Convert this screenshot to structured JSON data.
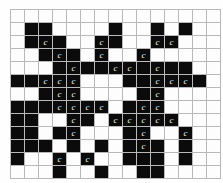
{
  "figure": {
    "type": "nonogram-grid",
    "title": "",
    "columns": 15,
    "rows": 13,
    "cell_size_px": 13,
    "colors": {
      "filled": "#0b0b0b",
      "empty": "#fdfdfd",
      "gridline": "#b9b9b9",
      "glyph": "#f2f2f2",
      "background": "#ffffff"
    },
    "marker_glyph": "c",
    "legend": {
      "filled_label": "",
      "empty_label": "",
      "marker_label": "c"
    }
  },
  "grid": {
    "cells": [
      [
        {
          "filled": false,
          "mark": ""
        },
        {
          "filled": false,
          "mark": ""
        },
        {
          "filled": false,
          "mark": ""
        },
        {
          "filled": false,
          "mark": ""
        },
        {
          "filled": false,
          "mark": ""
        },
        {
          "filled": false,
          "mark": ""
        },
        {
          "filled": false,
          "mark": ""
        },
        {
          "filled": false,
          "mark": ""
        },
        {
          "filled": false,
          "mark": ""
        },
        {
          "filled": false,
          "mark": ""
        },
        {
          "filled": false,
          "mark": ""
        },
        {
          "filled": false,
          "mark": ""
        },
        {
          "filled": false,
          "mark": ""
        },
        {
          "filled": false,
          "mark": ""
        },
        {
          "filled": false,
          "mark": ""
        }
      ],
      [
        {
          "filled": false,
          "mark": ""
        },
        {
          "filled": true,
          "mark": ""
        },
        {
          "filled": true,
          "mark": ""
        },
        {
          "filled": false,
          "mark": ""
        },
        {
          "filled": false,
          "mark": ""
        },
        {
          "filled": false,
          "mark": ""
        },
        {
          "filled": false,
          "mark": ""
        },
        {
          "filled": true,
          "mark": ""
        },
        {
          "filled": false,
          "mark": ""
        },
        {
          "filled": false,
          "mark": ""
        },
        {
          "filled": true,
          "mark": ""
        },
        {
          "filled": false,
          "mark": ""
        },
        {
          "filled": true,
          "mark": ""
        },
        {
          "filled": false,
          "mark": ""
        },
        {
          "filled": false,
          "mark": ""
        }
      ],
      [
        {
          "filled": false,
          "mark": ""
        },
        {
          "filled": true,
          "mark": ""
        },
        {
          "filled": true,
          "mark": "c"
        },
        {
          "filled": true,
          "mark": ""
        },
        {
          "filled": false,
          "mark": ""
        },
        {
          "filled": false,
          "mark": ""
        },
        {
          "filled": true,
          "mark": "c"
        },
        {
          "filled": true,
          "mark": ""
        },
        {
          "filled": false,
          "mark": ""
        },
        {
          "filled": false,
          "mark": ""
        },
        {
          "filled": true,
          "mark": "c"
        },
        {
          "filled": true,
          "mark": "c"
        },
        {
          "filled": false,
          "mark": ""
        },
        {
          "filled": false,
          "mark": ""
        },
        {
          "filled": false,
          "mark": ""
        }
      ],
      [
        {
          "filled": false,
          "mark": ""
        },
        {
          "filled": false,
          "mark": ""
        },
        {
          "filled": true,
          "mark": ""
        },
        {
          "filled": true,
          "mark": "c"
        },
        {
          "filled": true,
          "mark": ""
        },
        {
          "filled": false,
          "mark": ""
        },
        {
          "filled": true,
          "mark": "c"
        },
        {
          "filled": false,
          "mark": ""
        },
        {
          "filled": false,
          "mark": ""
        },
        {
          "filled": true,
          "mark": "c"
        },
        {
          "filled": false,
          "mark": ""
        },
        {
          "filled": false,
          "mark": ""
        },
        {
          "filled": false,
          "mark": ""
        },
        {
          "filled": false,
          "mark": ""
        },
        {
          "filled": false,
          "mark": ""
        }
      ],
      [
        {
          "filled": false,
          "mark": ""
        },
        {
          "filled": false,
          "mark": ""
        },
        {
          "filled": false,
          "mark": ""
        },
        {
          "filled": true,
          "mark": ""
        },
        {
          "filled": true,
          "mark": "c"
        },
        {
          "filled": true,
          "mark": ""
        },
        {
          "filled": true,
          "mark": ""
        },
        {
          "filled": true,
          "mark": "c"
        },
        {
          "filled": true,
          "mark": "c"
        },
        {
          "filled": true,
          "mark": ""
        },
        {
          "filled": true,
          "mark": "c"
        },
        {
          "filled": true,
          "mark": ""
        },
        {
          "filled": true,
          "mark": ""
        },
        {
          "filled": false,
          "mark": ""
        },
        {
          "filled": false,
          "mark": ""
        }
      ],
      [
        {
          "filled": true,
          "mark": ""
        },
        {
          "filled": true,
          "mark": ""
        },
        {
          "filled": true,
          "mark": "c"
        },
        {
          "filled": true,
          "mark": "c"
        },
        {
          "filled": true,
          "mark": "c"
        },
        {
          "filled": false,
          "mark": ""
        },
        {
          "filled": false,
          "mark": ""
        },
        {
          "filled": false,
          "mark": ""
        },
        {
          "filled": true,
          "mark": ""
        },
        {
          "filled": true,
          "mark": ""
        },
        {
          "filled": true,
          "mark": "c"
        },
        {
          "filled": true,
          "mark": "c"
        },
        {
          "filled": true,
          "mark": "c"
        },
        {
          "filled": true,
          "mark": ""
        },
        {
          "filled": false,
          "mark": ""
        }
      ],
      [
        {
          "filled": false,
          "mark": ""
        },
        {
          "filled": false,
          "mark": ""
        },
        {
          "filled": true,
          "mark": ""
        },
        {
          "filled": true,
          "mark": "c"
        },
        {
          "filled": true,
          "mark": "c"
        },
        {
          "filled": false,
          "mark": ""
        },
        {
          "filled": false,
          "mark": ""
        },
        {
          "filled": false,
          "mark": ""
        },
        {
          "filled": false,
          "mark": ""
        },
        {
          "filled": true,
          "mark": ""
        },
        {
          "filled": true,
          "mark": "c"
        },
        {
          "filled": false,
          "mark": ""
        },
        {
          "filled": false,
          "mark": ""
        },
        {
          "filled": false,
          "mark": ""
        },
        {
          "filled": false,
          "mark": ""
        }
      ],
      [
        {
          "filled": true,
          "mark": ""
        },
        {
          "filled": true,
          "mark": ""
        },
        {
          "filled": true,
          "mark": ""
        },
        {
          "filled": true,
          "mark": "c"
        },
        {
          "filled": true,
          "mark": "c"
        },
        {
          "filled": true,
          "mark": "c"
        },
        {
          "filled": true,
          "mark": "c"
        },
        {
          "filled": false,
          "mark": ""
        },
        {
          "filled": true,
          "mark": ""
        },
        {
          "filled": true,
          "mark": "c"
        },
        {
          "filled": true,
          "mark": "c"
        },
        {
          "filled": false,
          "mark": ""
        },
        {
          "filled": false,
          "mark": ""
        },
        {
          "filled": false,
          "mark": ""
        },
        {
          "filled": false,
          "mark": ""
        }
      ],
      [
        {
          "filled": true,
          "mark": ""
        },
        {
          "filled": true,
          "mark": ""
        },
        {
          "filled": false,
          "mark": ""
        },
        {
          "filled": false,
          "mark": ""
        },
        {
          "filled": true,
          "mark": "c"
        },
        {
          "filled": true,
          "mark": ""
        },
        {
          "filled": false,
          "mark": ""
        },
        {
          "filled": true,
          "mark": "c"
        },
        {
          "filled": true,
          "mark": "c"
        },
        {
          "filled": true,
          "mark": "c"
        },
        {
          "filled": true,
          "mark": "c"
        },
        {
          "filled": true,
          "mark": "c"
        },
        {
          "filled": false,
          "mark": ""
        },
        {
          "filled": false,
          "mark": ""
        },
        {
          "filled": false,
          "mark": ""
        }
      ],
      [
        {
          "filled": true,
          "mark": ""
        },
        {
          "filled": true,
          "mark": ""
        },
        {
          "filled": false,
          "mark": ""
        },
        {
          "filled": true,
          "mark": ""
        },
        {
          "filled": true,
          "mark": "c"
        },
        {
          "filled": false,
          "mark": ""
        },
        {
          "filled": false,
          "mark": ""
        },
        {
          "filled": false,
          "mark": ""
        },
        {
          "filled": true,
          "mark": ""
        },
        {
          "filled": true,
          "mark": "c"
        },
        {
          "filled": false,
          "mark": ""
        },
        {
          "filled": false,
          "mark": ""
        },
        {
          "filled": true,
          "mark": "c"
        },
        {
          "filled": false,
          "mark": ""
        },
        {
          "filled": false,
          "mark": ""
        }
      ],
      [
        {
          "filled": true,
          "mark": ""
        },
        {
          "filled": true,
          "mark": ""
        },
        {
          "filled": true,
          "mark": ""
        },
        {
          "filled": false,
          "mark": ""
        },
        {
          "filled": true,
          "mark": ""
        },
        {
          "filled": false,
          "mark": ""
        },
        {
          "filled": true,
          "mark": ""
        },
        {
          "filled": false,
          "mark": ""
        },
        {
          "filled": true,
          "mark": ""
        },
        {
          "filled": true,
          "mark": "c"
        },
        {
          "filled": true,
          "mark": ""
        },
        {
          "filled": false,
          "mark": ""
        },
        {
          "filled": true,
          "mark": ""
        },
        {
          "filled": false,
          "mark": ""
        },
        {
          "filled": false,
          "mark": ""
        }
      ],
      [
        {
          "filled": true,
          "mark": ""
        },
        {
          "filled": false,
          "mark": ""
        },
        {
          "filled": false,
          "mark": ""
        },
        {
          "filled": true,
          "mark": "c"
        },
        {
          "filled": false,
          "mark": ""
        },
        {
          "filled": true,
          "mark": "c"
        },
        {
          "filled": false,
          "mark": ""
        },
        {
          "filled": false,
          "mark": ""
        },
        {
          "filled": true,
          "mark": ""
        },
        {
          "filled": true,
          "mark": ""
        },
        {
          "filled": true,
          "mark": ""
        },
        {
          "filled": false,
          "mark": ""
        },
        {
          "filled": true,
          "mark": ""
        },
        {
          "filled": false,
          "mark": ""
        },
        {
          "filled": false,
          "mark": ""
        }
      ],
      [
        {
          "filled": false,
          "mark": ""
        },
        {
          "filled": false,
          "mark": ""
        },
        {
          "filled": false,
          "mark": ""
        },
        {
          "filled": true,
          "mark": ""
        },
        {
          "filled": false,
          "mark": ""
        },
        {
          "filled": false,
          "mark": ""
        },
        {
          "filled": true,
          "mark": ""
        },
        {
          "filled": false,
          "mark": ""
        },
        {
          "filled": false,
          "mark": ""
        },
        {
          "filled": true,
          "mark": ""
        },
        {
          "filled": true,
          "mark": ""
        },
        {
          "filled": false,
          "mark": ""
        },
        {
          "filled": false,
          "mark": ""
        },
        {
          "filled": false,
          "mark": ""
        },
        {
          "filled": false,
          "mark": ""
        }
      ]
    ]
  }
}
